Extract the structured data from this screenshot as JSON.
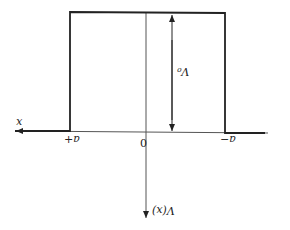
{
  "diagram": {
    "type": "square potential well (rendered upside-down)",
    "labels": {
      "x_axis": "x",
      "y_axis": "V(x)",
      "origin": "0",
      "left_edge": "a+",
      "right_edge": "a−",
      "height": "V₀"
    },
    "colors": {
      "line": "#222222",
      "axis": "#555555",
      "background": "#ffffff"
    }
  }
}
